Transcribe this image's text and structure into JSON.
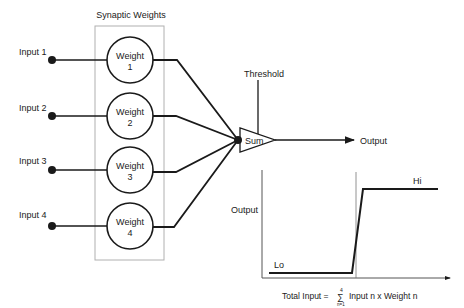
{
  "diagram": {
    "box_title": "Synaptic Weights",
    "inputs": [
      {
        "label": "Input 1",
        "weight_line1": "Weight",
        "weight_line2": "1"
      },
      {
        "label": "Input 2",
        "weight_line1": "Weight",
        "weight_line2": "2"
      },
      {
        "label": "Input 3",
        "weight_line1": "Weight",
        "weight_line2": "3"
      },
      {
        "label": "Input 4",
        "weight_line1": "Weight",
        "weight_line2": "4"
      }
    ],
    "sum_label": "Sum",
    "threshold_label": "Threshold",
    "output_label": "Output"
  },
  "graph": {
    "y_label": "Output",
    "lo_label": "Lo",
    "hi_label": "Hi",
    "x_label_prefix": "Total Input =",
    "sigma_top": "4",
    "sigma_bottom": "n=1",
    "x_label_suffix": "Input n x Weight n"
  },
  "colors": {
    "line": "#1a1a1a",
    "box": "#b0b0b0"
  }
}
